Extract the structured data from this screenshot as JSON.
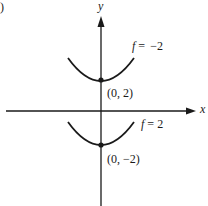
{
  "figure": {
    "panel_label_fragment": ")",
    "axes": {
      "x_label": "x",
      "y_label": "y"
    },
    "curves": [
      {
        "name": "upper-level-curve",
        "label_var": "f",
        "label_eq": "=",
        "label_value": "−2",
        "vertex_label": "(0, 2)",
        "vertex": [
          0,
          2
        ],
        "shape": "parabola opening upward"
      },
      {
        "name": "lower-level-curve",
        "label_var": "f",
        "label_eq": "=",
        "label_value": "2",
        "vertex_label": "(0, −2)",
        "vertex": [
          0,
          -2
        ],
        "shape": "parabola opening upward"
      }
    ],
    "colors": {
      "ink": "#1a1a1a",
      "background": "#ffffff"
    }
  }
}
